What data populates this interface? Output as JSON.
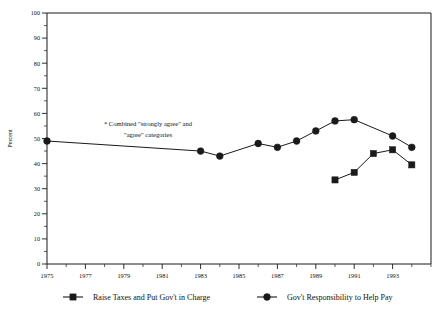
{
  "chart_data": {
    "type": "line",
    "title": "",
    "xlabel": "",
    "ylabel": "Percent",
    "ylim": [
      0,
      100
    ],
    "xlim": [
      1975,
      1995
    ],
    "ytick_labels": [
      "0",
      "10",
      "20",
      "30",
      "40",
      "50",
      "60",
      "70",
      "80",
      "90",
      "100"
    ],
    "ytick_values": [
      0,
      10,
      20,
      30,
      40,
      50,
      60,
      70,
      80,
      90,
      100
    ],
    "ytick_minor_step": 5,
    "xtick_labels": [
      "1975",
      "1977",
      "1979",
      "1981",
      "1983",
      "1985",
      "1987",
      "1989",
      "1991",
      "1993"
    ],
    "xtick_values": [
      1975,
      1977,
      1979,
      1981,
      1983,
      1985,
      1987,
      1989,
      1991,
      1993
    ],
    "xtick_minor_step": 1,
    "grid": false,
    "legend_position": "bottom",
    "annotation": "* Combined \"strongly agree\" and \"agree\" categories",
    "series": [
      {
        "name": "Gov't Responsibility to Help Pay",
        "marker": "circle",
        "color": "#1a1a1a",
        "x": [
          1975,
          1983,
          1984,
          1986,
          1987,
          1988,
          1989,
          1990,
          1991,
          1993,
          1994
        ],
        "values": [
          49,
          45,
          43,
          48,
          46.5,
          49,
          53,
          57,
          57.5,
          51,
          46.5
        ]
      },
      {
        "name": "Raise Taxes and Put Gov't in Charge",
        "marker": "square",
        "color": "#1a1a1a",
        "x": [
          1990,
          1991,
          1992,
          1993,
          1994
        ],
        "values": [
          33.5,
          36.5,
          44,
          45.5,
          39.5
        ]
      }
    ]
  },
  "legend": {
    "items": [
      {
        "label": "Raise Taxes and Put Gov't in Charge",
        "marker": "square"
      },
      {
        "label": "Gov't Responsibility to Help Pay",
        "marker": "circle"
      }
    ]
  },
  "annotation": {
    "line1": "* Combined \"strongly agree\" and",
    "line2": "\"agree\" categories"
  },
  "axis": {
    "y_title": "Percent"
  }
}
